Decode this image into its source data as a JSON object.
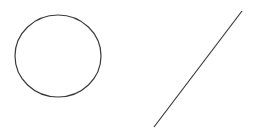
{
  "canvas": {
    "width": 253,
    "height": 132,
    "background": "#ffffff"
  },
  "shapes": {
    "circle": {
      "cx": 58,
      "cy": 56,
      "rx": 43,
      "ry": 41,
      "stroke": "#3a3a3a",
      "stroke_width": 1.2
    },
    "line": {
      "x1": 242,
      "y1": 11,
      "x2": 154,
      "y2": 127,
      "stroke": "#3a3a3a",
      "stroke_width": 1.2
    }
  }
}
